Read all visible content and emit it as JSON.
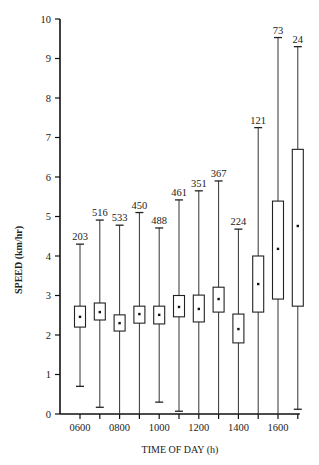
{
  "chart_data": {
    "type": "box",
    "title": "",
    "xlabel": "TIME OF DAY (h)",
    "ylabel": "SPEED (km/hr)",
    "ylim": [
      0,
      10
    ],
    "yticks": [
      0,
      1,
      2,
      3,
      4,
      5,
      6,
      7,
      8,
      9,
      10
    ],
    "xtick_labels": [
      "0600",
      "0800",
      "1000",
      "1200",
      "1400",
      "1600"
    ],
    "grid": false,
    "legend": null,
    "categories": [
      "0600",
      "0700",
      "0800",
      "0900",
      "1000",
      "1100",
      "1200",
      "1300",
      "1400",
      "1500",
      "1600",
      "1700"
    ],
    "boxes": [
      {
        "hour": "0600",
        "n": 203,
        "min": 0.7,
        "q1": 2.2,
        "mean": 2.46,
        "q3": 2.73,
        "max": 4.3
      },
      {
        "hour": "0700",
        "n": 516,
        "min": 0.17,
        "q1": 2.38,
        "mean": 2.58,
        "q3": 2.81,
        "max": 4.91
      },
      {
        "hour": "0800",
        "n": 533,
        "min": 0.0,
        "q1": 2.1,
        "mean": 2.3,
        "q3": 2.51,
        "max": 4.78
      },
      {
        "hour": "0900",
        "n": 450,
        "min": 0.0,
        "q1": 2.3,
        "mean": 2.53,
        "q3": 2.73,
        "max": 5.1
      },
      {
        "hour": "1000",
        "n": 488,
        "min": 0.3,
        "q1": 2.28,
        "mean": 2.51,
        "q3": 2.73,
        "max": 4.71
      },
      {
        "hour": "1100",
        "n": 461,
        "min": 0.07,
        "q1": 2.46,
        "mean": 2.71,
        "q3": 3.0,
        "max": 5.42
      },
      {
        "hour": "1200",
        "n": 351,
        "min": 0.0,
        "q1": 2.33,
        "mean": 2.66,
        "q3": 3.01,
        "max": 5.65
      },
      {
        "hour": "1300",
        "n": 367,
        "min": 0.0,
        "q1": 2.58,
        "mean": 2.91,
        "q3": 3.21,
        "max": 5.9
      },
      {
        "hour": "1400",
        "n": 224,
        "min": 0.0,
        "q1": 1.8,
        "mean": 2.15,
        "q3": 2.53,
        "max": 4.68
      },
      {
        "hour": "1500",
        "n": 121,
        "min": 0.0,
        "q1": 2.58,
        "mean": 3.29,
        "q3": 4.0,
        "max": 7.25
      },
      {
        "hour": "1600",
        "n": 73,
        "min": 0.0,
        "q1": 2.91,
        "mean": 4.18,
        "q3": 5.39,
        "max": 9.53
      },
      {
        "hour": "1700",
        "n": 24,
        "min": 0.12,
        "q1": 2.73,
        "mean": 4.76,
        "q3": 6.7,
        "max": 9.3
      }
    ],
    "annotations": "Numbers above whiskers are sample sizes (n)"
  }
}
